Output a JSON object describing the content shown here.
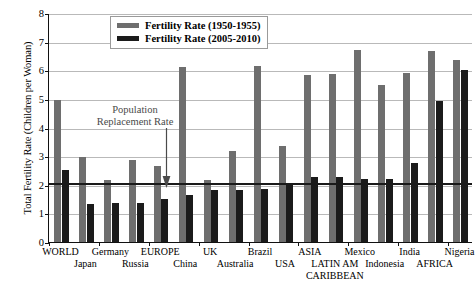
{
  "chart_data": {
    "type": "bar",
    "title": "",
    "xlabel": "",
    "ylabel": "Total Fertility Rate (Children per Woman)",
    "ylim": [
      0,
      8
    ],
    "yticks": [
      0,
      1,
      2,
      3,
      4,
      5,
      6,
      7,
      8
    ],
    "grid": true,
    "legend_position": "top-center",
    "categories": [
      "WORLD",
      "Japan",
      "Germany",
      "Russia",
      "EUROPE",
      "China",
      "UK",
      "Australia",
      "Brazil",
      "USA",
      "ASIA",
      "LATIN AM CARIBBEAN",
      "Mexico",
      "Indonesia",
      "India",
      "AFRICA",
      "Nigeria"
    ],
    "series": [
      {
        "name": "Fertility Rate (1950-1955)",
        "color": "#6e6e6e",
        "values": [
          4.97,
          2.97,
          2.16,
          2.85,
          2.66,
          6.11,
          2.18,
          3.18,
          6.15,
          3.35,
          5.85,
          5.87,
          6.7,
          5.49,
          5.9,
          6.67,
          6.37
        ]
      },
      {
        "name": "Fertility Rate (2005-2010)",
        "color": "#1b1b1b",
        "values": [
          2.52,
          1.32,
          1.36,
          1.37,
          1.5,
          1.64,
          1.83,
          1.81,
          1.86,
          2.07,
          2.28,
          2.26,
          2.21,
          2.19,
          2.76,
          4.94,
          6.0
        ]
      }
    ],
    "annotations": [
      {
        "name": "population-replacement-rate",
        "text_line1": "Population",
        "text_line2": "Replacement Rate",
        "value": 2.1,
        "has_arrow": true
      }
    ],
    "reference_line": {
      "label": "Population Replacement Rate",
      "value": 2.1,
      "color": "#1a1a1a"
    }
  },
  "legend": {
    "items": [
      {
        "label": "Fertility Rate (1950-1955)",
        "color": "#6e6e6e"
      },
      {
        "label": "Fertility Rate (2005-2010)",
        "color": "#1b1b1b"
      }
    ]
  },
  "axis": {
    "y_title": "Total Fertility Rate (Children per Woman)",
    "y_tick_labels": [
      "0",
      "1",
      "2",
      "3",
      "4",
      "5",
      "6",
      "7",
      "8"
    ]
  },
  "x_labels": [
    {
      "text": "WORLD",
      "row": 0
    },
    {
      "text": "Japan",
      "row": 1
    },
    {
      "text": "Germany",
      "row": 0
    },
    {
      "text": "Russia",
      "row": 1
    },
    {
      "text": "EUROPE",
      "row": 0
    },
    {
      "text": "China",
      "row": 1
    },
    {
      "text": "UK",
      "row": 0
    },
    {
      "text": "Australia",
      "row": 1
    },
    {
      "text": "Brazil",
      "row": 0
    },
    {
      "text": "USA",
      "row": 1
    },
    {
      "text": "ASIA",
      "row": 0
    },
    {
      "text": "LATIN AM",
      "row": 1
    },
    {
      "text": "CARIBBEAN",
      "row": 2
    },
    {
      "text": "Mexico",
      "row": 0
    },
    {
      "text": "Indonesia",
      "row": 1
    },
    {
      "text": "India",
      "row": 0
    },
    {
      "text": "AFRICA",
      "row": 1
    },
    {
      "text": "Nigeria",
      "row": 0
    }
  ],
  "annotation": {
    "line1": "Population",
    "line2": "Replacement Rate"
  }
}
